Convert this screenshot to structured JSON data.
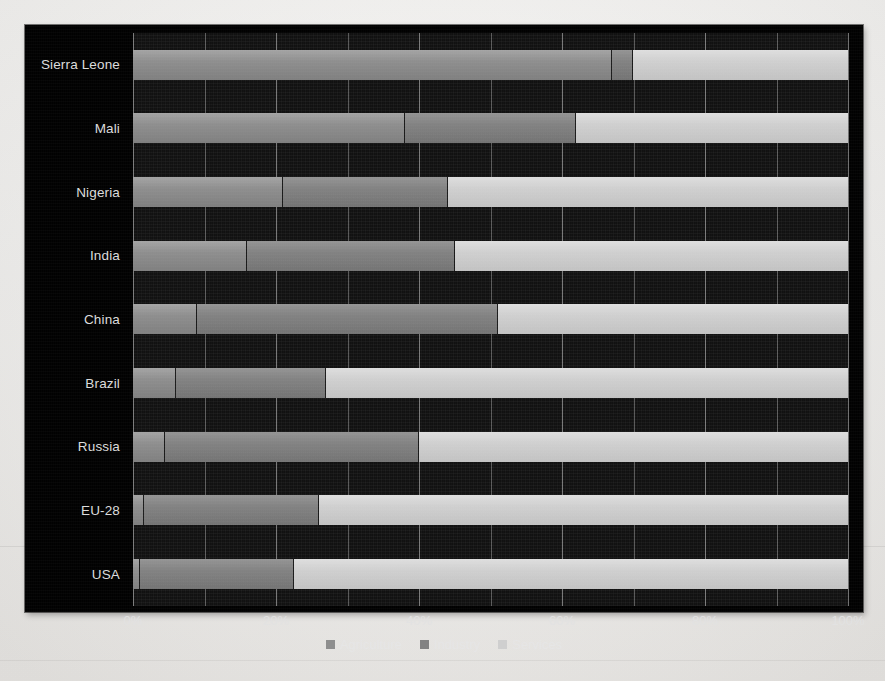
{
  "chart_data": {
    "type": "bar",
    "subtype": "stacked-horizontal-100pct",
    "title": "",
    "xlabel": "",
    "ylabel": "",
    "xlim": [
      0,
      100
    ],
    "grid": true,
    "grid_step": 10,
    "legend_position": "bottom",
    "orientation": "horizontal",
    "categories": [
      "Sierra Leone",
      "Mali",
      "Nigeria",
      "India",
      "China",
      "Brazil",
      "Russia",
      "EU-28",
      "USA"
    ],
    "xtick_labels": [
      "0%",
      "20%",
      "40%",
      "60%",
      "80%",
      "100%"
    ],
    "xtick_values": [
      0,
      20,
      40,
      60,
      80,
      100
    ],
    "series": [
      {
        "name": "Agriculture",
        "color": "#8e8e8e",
        "values": [
          67,
          38,
          21,
          16,
          9,
          6,
          4.5,
          1.5,
          1
        ]
      },
      {
        "name": "Industry",
        "color": "#828282",
        "values": [
          3,
          24,
          23,
          29,
          42,
          21,
          35.5,
          24.5,
          21.5
        ]
      },
      {
        "name": "Services",
        "color": "#cfcfcf",
        "values": [
          30,
          38,
          56,
          55,
          49,
          73,
          60,
          74,
          77.5
        ]
      }
    ]
  },
  "colors": {
    "background": "#010101",
    "plot_background": "#111111",
    "gridline": "#bebebe",
    "text": "#dcdcdc",
    "agriculture": "#8e8e8e",
    "industry": "#828282",
    "services": "#cfcfcf"
  }
}
